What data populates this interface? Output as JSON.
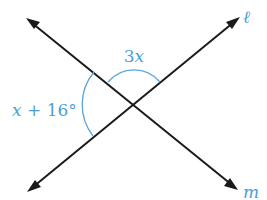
{
  "diagram": {
    "type": "intersecting-lines",
    "colors": {
      "lines": "#1a1a1a",
      "annotations": "#4a9fd8"
    },
    "intersection": {
      "x": 134,
      "y": 104
    },
    "lines": [
      {
        "name": "ℓ",
        "label": "ℓ",
        "from": {
          "x": 27,
          "y": 192
        },
        "to": {
          "x": 240,
          "y": 17
        },
        "arrows": "both"
      },
      {
        "name": "m",
        "label": "m",
        "from": {
          "x": 26,
          "y": 18
        },
        "to": {
          "x": 238,
          "y": 190
        },
        "arrows": "both"
      }
    ],
    "angles": [
      {
        "position": "top",
        "label": "3x",
        "coefficient": "3",
        "variable": "x"
      },
      {
        "position": "left",
        "label": "x + 16°",
        "variable": "x",
        "operator": "+",
        "constant": "16",
        "unit": "°"
      }
    ]
  },
  "labels": {
    "line_l": "ℓ",
    "line_m": "m",
    "angle_top_coef": "3",
    "angle_top_var": "x",
    "angle_left_var": "x",
    "angle_left_rest": " + 16°"
  }
}
